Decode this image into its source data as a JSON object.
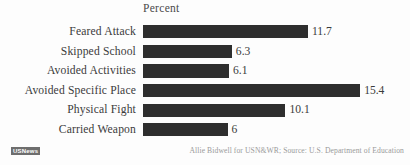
{
  "chart_data": {
    "type": "bar",
    "orientation": "horizontal",
    "title": "Percent",
    "xlabel": "",
    "ylabel": "",
    "categories": [
      "Feared Attack",
      "Skipped School",
      "Avoided Activities",
      "Avoided Specific Place",
      "Physical Fight",
      "Carried Weapon"
    ],
    "values": [
      11.7,
      6.3,
      6.1,
      15.4,
      10.1,
      6
    ],
    "value_labels": [
      "11.7",
      "6.3",
      "6.1",
      "15.4",
      "10.1",
      "6"
    ],
    "xlim": [
      0,
      15.4
    ],
    "grid": false,
    "legend": false,
    "bar_color": "#2e2e2e",
    "background_color": "#fdfdfd",
    "text_color": "#3b3b3b"
  },
  "footer": {
    "logo_text": "USNews",
    "credit": "Allie Bidwell for USN&WR; Source: U.S. Department of Education"
  }
}
